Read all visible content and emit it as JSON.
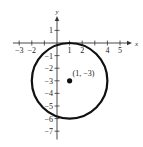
{
  "chart_data": {
    "type": "scatter",
    "title": "",
    "xlabel": "x",
    "ylabel": "y",
    "xlim": [
      -3.5,
      5.7
    ],
    "ylim": [
      -7.5,
      2.2
    ],
    "x_ticks": [
      -3,
      -2,
      -1,
      1,
      2,
      3,
      4,
      5
    ],
    "x_tick_labels": [
      "-3",
      "-2",
      "",
      "1",
      "2",
      "",
      "4",
      "5"
    ],
    "y_ticks": [
      1,
      -1,
      -2,
      -3,
      -4,
      -5,
      -6,
      -7
    ],
    "y_tick_labels": [
      "1",
      "-1",
      "-2",
      "-3",
      "-4",
      "-5",
      "-6",
      "-7"
    ],
    "grid": false,
    "shapes": [
      {
        "kind": "circle",
        "center": [
          1,
          -3
        ],
        "radius": 3,
        "stroke": "#111111"
      }
    ],
    "points": [
      {
        "x": 1,
        "y": -3,
        "label": "(1, −3)"
      }
    ]
  },
  "labels": {
    "x_axis": "x",
    "y_axis": "y",
    "center_point": "(1, −3)"
  }
}
